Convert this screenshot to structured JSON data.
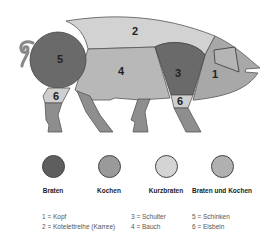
{
  "diagram": {
    "regions": [
      {
        "id": "1",
        "name": "Kopf",
        "color": "#a8a8a8"
      },
      {
        "id": "2",
        "name": "Kotelettreihe (Karree)",
        "color": "#d2d2d2"
      },
      {
        "id": "3",
        "name": "Schulter",
        "color": "#6a6a6a"
      },
      {
        "id": "4",
        "name": "Bauch",
        "color": "#b8b8b8"
      },
      {
        "id": "5",
        "name": "Schinken",
        "color": "#6a6a6a"
      },
      {
        "id": "6",
        "name": "Eisbein",
        "color": "#cfcfcf"
      }
    ],
    "labels": {
      "r1": "1",
      "r2": "2",
      "r3": "3",
      "r4": "4",
      "r5": "5",
      "r6a": "6",
      "r6b": "6"
    }
  },
  "legend": {
    "items": [
      {
        "label": "Braten",
        "color": "#5e5e5e"
      },
      {
        "label": "Kochen",
        "color": "#9a9a9a"
      },
      {
        "label": "Kurzbraten",
        "color": "#d4d4d4"
      },
      {
        "label": "Braten und Kochen",
        "color": "#b0b0b0"
      }
    ]
  },
  "key": {
    "col1": [
      "1 = Kopf",
      "2 = Kotelettreihe (Karree)"
    ],
    "col2": [
      "3 = Schulter",
      "4 = Bauch"
    ],
    "col3": [
      "5 = Schinken",
      "6 = Eisbein"
    ]
  }
}
